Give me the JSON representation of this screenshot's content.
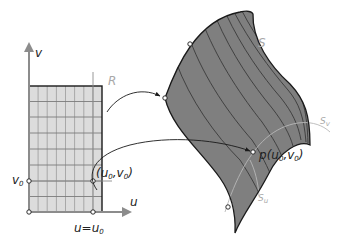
{
  "diagram": {
    "domain_region": {
      "label": "R",
      "axis_u_label": "u",
      "axis_v_label": "v",
      "v0_label": "v",
      "v0_sub": "0",
      "u0_label": "u=u",
      "u0_sub": "0",
      "point_label_open": "(u",
      "point_label_u_sub": "0",
      "point_label_mid": ",v",
      "point_label_v_sub": "0",
      "point_label_close": ")",
      "grid_columns": 8,
      "grid_rows": 9,
      "fill_color": "#dcdcdc",
      "grid_color": "#8a8a8a"
    },
    "surface": {
      "label": "S",
      "point_label_p": "p",
      "point_label_open": "(u",
      "point_label_u_sub": "0",
      "point_label_mid": ",v",
      "point_label_v_sub": "0",
      "point_label_close": ")",
      "curve_su_label": "S",
      "curve_su_sub": "u",
      "curve_sv_label": "S",
      "curve_sv_sub": "v",
      "fill_color": "#7f7f7f",
      "isocurve_color": "#3a3a3a"
    },
    "colors": {
      "outline": "#1a1a1a",
      "axis": "#8c8c8c",
      "light_label": "#a8a8a8",
      "arrow": "#1a1a1a"
    }
  }
}
